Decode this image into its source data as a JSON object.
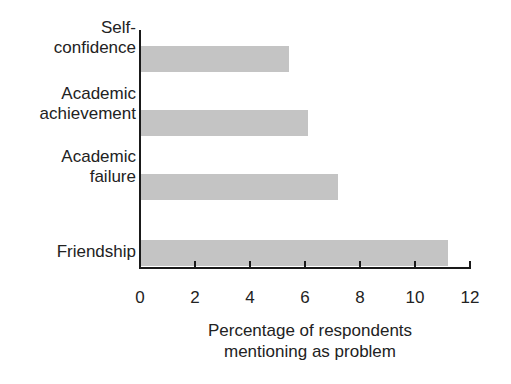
{
  "chart_data": {
    "type": "bar",
    "orientation": "horizontal",
    "title": "",
    "categories": [
      "Self-confidence",
      "Academic achievement",
      "Academic failure",
      "Friendship"
    ],
    "category_labels": [
      [
        "Self-",
        "confidence"
      ],
      [
        "Academic",
        "achievement"
      ],
      [
        "Academic",
        "failure"
      ],
      [
        "Friendship"
      ]
    ],
    "values": [
      5.4,
      6.1,
      7.2,
      11.2
    ],
    "xlabel": "Percentage of respondents mentioning as problem",
    "xlabel_lines": [
      "Percentage of respondents",
      "mentioning as problem"
    ],
    "ylabel": "",
    "xlim": [
      0,
      12
    ],
    "xticks": [
      "0",
      "2",
      "4",
      "6",
      "8",
      "10",
      "12"
    ],
    "grid": false,
    "legend": null,
    "bar_color": "#c4c4c4"
  }
}
